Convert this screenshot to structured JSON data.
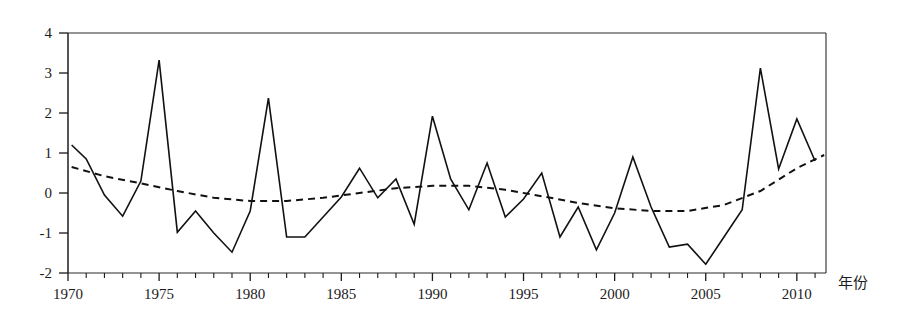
{
  "chart_data": {
    "type": "line",
    "title": "",
    "subtitle": "",
    "xlabel": "年份",
    "ylabel": "",
    "xlim": [
      1970,
      2011.6
    ],
    "ylim": [
      -2,
      4
    ],
    "grid": false,
    "legend": "none",
    "y_ticks": [
      4,
      3,
      2,
      1,
      0,
      -1,
      -2
    ],
    "y_tick_labels": [
      "4",
      "3",
      "2",
      "1",
      "0",
      "-1",
      "-2"
    ],
    "x_ticks": [
      1970,
      1975,
      1980,
      1985,
      1990,
      1995,
      2000,
      2005,
      2010
    ],
    "x_tick_labels": [
      "1970",
      "1975",
      "1980",
      "1985",
      "1990",
      "1995",
      "2000",
      "2005",
      "2010"
    ],
    "x_minor_tick_step": 1,
    "series": [
      {
        "name": "annual-series",
        "style": "solid",
        "x": [
          1970.2,
          1971,
          1972,
          1973,
          1974,
          1975,
          1976,
          1977,
          1978,
          1979,
          1980,
          1981,
          1982,
          1983,
          1984,
          1985,
          1986,
          1987,
          1988,
          1989,
          1990,
          1991,
          1992,
          1993,
          1994,
          1995,
          1996,
          1997,
          1998,
          1999,
          2000,
          2001,
          2002,
          2003,
          2004,
          2005,
          2006,
          2007,
          2008,
          2009,
          2010,
          2011
        ],
        "values": [
          1.2,
          0.85,
          -0.05,
          -0.58,
          0.3,
          3.32,
          -0.98,
          -0.45,
          -1.0,
          -1.48,
          -0.45,
          2.37,
          -1.1,
          -1.1,
          -0.6,
          -0.1,
          0.62,
          -0.12,
          0.35,
          -0.78,
          1.92,
          0.35,
          -0.42,
          0.75,
          -0.6,
          -0.15,
          0.5,
          -1.1,
          -0.35,
          -1.42,
          -0.5,
          0.9,
          -0.35,
          -1.35,
          -1.28,
          -1.78,
          -1.1,
          -0.42,
          3.12,
          0.6,
          1.85,
          0.8
        ]
      },
      {
        "name": "smoothed-trend",
        "style": "dashed",
        "x": [
          1970.2,
          1972,
          1974,
          1976,
          1978,
          1980,
          1982,
          1984,
          1986,
          1988,
          1990,
          1992,
          1994,
          1996,
          1998,
          2000,
          2002,
          2004,
          2006,
          2008,
          2010,
          2011.5
        ],
        "values": [
          0.65,
          0.42,
          0.24,
          0.05,
          -0.12,
          -0.2,
          -0.2,
          -0.12,
          0.0,
          0.12,
          0.18,
          0.18,
          0.08,
          -0.08,
          -0.25,
          -0.38,
          -0.45,
          -0.45,
          -0.3,
          0.05,
          0.62,
          0.95
        ]
      }
    ]
  },
  "axes": {
    "x_axis_title": "年份"
  }
}
